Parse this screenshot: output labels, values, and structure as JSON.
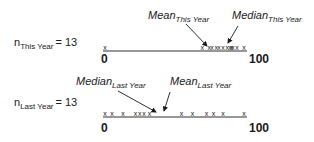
{
  "chart_data": [
    {
      "type": "scatter",
      "subtype": "dot-plot",
      "title": "This Year",
      "n_label": "n",
      "n_subscript": "This Year",
      "n_value": "= 13",
      "xlim": [
        0,
        100
      ],
      "tick_labels": [
        "0",
        "100"
      ],
      "marker": "x",
      "values": [
        0,
        70,
        75,
        77,
        80,
        82,
        85,
        88,
        90,
        91,
        92,
        95,
        100
      ],
      "annotations": [
        {
          "label": "Mean",
          "subscript": "This Year",
          "x": 78
        },
        {
          "label": "Median",
          "subscript": "This Year",
          "x": 85
        }
      ]
    },
    {
      "type": "scatter",
      "subtype": "dot-plot",
      "title": "Last Year",
      "n_label": "n",
      "n_subscript": "Last Year",
      "n_value": "= 13",
      "xlim": [
        0,
        100
      ],
      "tick_labels": [
        "0",
        "100"
      ],
      "marker": "x",
      "values": [
        0,
        5,
        13,
        22,
        25,
        28,
        32,
        55,
        63,
        73,
        78,
        85,
        100
      ],
      "annotations": [
        {
          "label": "Median",
          "subscript": "Last Year",
          "x": 32
        },
        {
          "label": "Mean",
          "subscript": "Last Year",
          "x": 42
        }
      ]
    }
  ]
}
